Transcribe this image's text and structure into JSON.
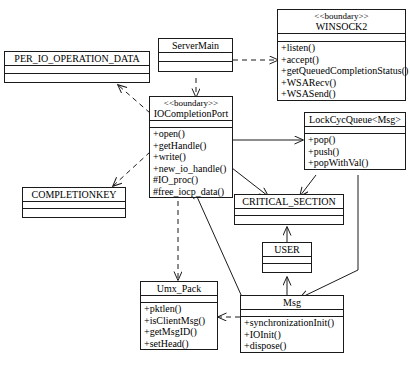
{
  "diagram": {
    "kind": "UML class diagram",
    "background_color": "#ffffff",
    "line_color": "#1a1a1a"
  },
  "classes": {
    "per_io_operation_data": {
      "name": "PER_IO_OPERATION_DATA",
      "stereotype": "",
      "attributes": [],
      "operations": []
    },
    "server_main": {
      "name": "ServerMain",
      "stereotype": "",
      "attributes": [],
      "operations": []
    },
    "winsock2": {
      "name": "WINSOCK2",
      "stereotype": "<<boundary>>",
      "attributes": [],
      "operations": [
        "+listen()",
        "+accept()",
        "+getQueuedCompletionStatus()",
        "+WSARecv()",
        "+WSASend()"
      ]
    },
    "iocompletion_port": {
      "name": "IOCompletionPort",
      "stereotype": "<<boundary>>",
      "attributes": [],
      "operations": [
        "+open()",
        "+getHandle()",
        "+write()",
        "+new_io_handle()",
        "#IO_proc()",
        "#free_iocp_data()"
      ]
    },
    "lock_cyc_queue": {
      "name": "LockCycQueue<Msg>",
      "stereotype": "",
      "attributes": [],
      "operations": [
        "+pop()",
        "+push()",
        "+popWithVal()"
      ]
    },
    "completionkey": {
      "name": "COMPLETIONKEY",
      "stereotype": "",
      "attributes": [],
      "operations": []
    },
    "critical_section": {
      "name": "CRITICAL_SECTION",
      "stereotype": "",
      "attributes": [],
      "operations": []
    },
    "user": {
      "name": "USER",
      "stereotype": "",
      "attributes": [],
      "operations": []
    },
    "umx_pack": {
      "name": "Umx_Pack",
      "stereotype": "",
      "attributes": [],
      "operations": [
        "+pktlen()",
        "+isClientMsg()",
        "+getMsgID()",
        "+setHead()"
      ]
    },
    "msg": {
      "name": "Msg",
      "stereotype": "",
      "attributes": [],
      "operations": [
        "+synchronizationInit()",
        "+IOInit()",
        "+dispose()"
      ]
    }
  },
  "relations": [
    {
      "id": "servermain-to-winsock2",
      "from": "ServerMain",
      "to": "WINSOCK2",
      "style": "dashed"
    },
    {
      "id": "servermain-to-iocompletionport",
      "from": "ServerMain",
      "to": "IOCompletionPort",
      "style": "dashed"
    },
    {
      "id": "iocompletionport-to-per-io-operation-data",
      "from": "IOCompletionPort",
      "to": "PER_IO_OPERATION_DATA",
      "style": "dashed"
    },
    {
      "id": "iocompletionport-to-completionkey",
      "from": "IOCompletionPort",
      "to": "COMPLETIONKEY",
      "style": "dashed"
    },
    {
      "id": "iocompletionport-to-lockcycqueue",
      "from": "IOCompletionPort",
      "to": "LockCycQueue<Msg>",
      "style": "solid"
    },
    {
      "id": "iocompletionport-to-critical-section",
      "from": "IOCompletionPort",
      "to": "CRITICAL_SECTION",
      "style": "solid"
    },
    {
      "id": "iocompletionport-to-umx-pack",
      "from": "IOCompletionPort",
      "to": "Umx_Pack",
      "style": "dashed"
    },
    {
      "id": "lockcycqueue-to-critical-section",
      "from": "LockCycQueue<Msg>",
      "to": "CRITICAL_SECTION",
      "style": "solid"
    },
    {
      "id": "lockcycqueue-to-msg",
      "from": "LockCycQueue<Msg>",
      "to": "Msg",
      "style": "solid"
    },
    {
      "id": "user-to-critical-section",
      "from": "USER",
      "to": "CRITICAL_SECTION",
      "style": "solid"
    },
    {
      "id": "msg-to-user",
      "from": "Msg",
      "to": "USER",
      "style": "solid"
    },
    {
      "id": "msg-to-iocompletionport",
      "from": "Msg",
      "to": "IOCompletionPort",
      "style": "solid"
    },
    {
      "id": "msg-to-umx-pack",
      "from": "Msg",
      "to": "Umx_Pack",
      "style": "dashed"
    }
  ]
}
